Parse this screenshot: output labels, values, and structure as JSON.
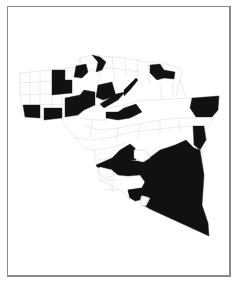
{
  "map": {
    "type": "choropleth",
    "legend": [],
    "colors": {
      "shaded": "#111111",
      "unshaded": "#ffffff",
      "boundary": "#b9b9b9",
      "frame": "#8a8a8a"
    },
    "region_outline": "20,73 50,70 78,67 80,58 92,55 112,57 125,58 148,62 160,62 173,66 182,70 180,80 186,98 198,99 218,96 218,110 210,125 205,130 207,145 202,150 204,175 202,205 208,223 209,236 150,209 140,200 130,198 120,190 110,185 100,180 97,165 95,160 95,150 85,148 75,138 68,130 62,120 58,115 42,118 35,115 22,110 20,95",
    "shaded_regions": [
      {
        "id": "nw-col",
        "points": "52,70 65,70 65,80 72,80 72,93 52,95"
      },
      {
        "id": "nw-bottom-left",
        "points": "23,105 40,105 40,118 25,117"
      },
      {
        "id": "nw-bottom",
        "points": "44,108 62,108 62,118 44,120"
      },
      {
        "id": "n-center-1",
        "points": "76,66 86,64 88,72 82,78 74,77"
      },
      {
        "id": "n-center-2",
        "points": "65,98 80,95 84,90 95,92 95,105 84,110 78,115 65,117 65,110"
      },
      {
        "id": "n-top-1",
        "points": "92,55 100,57 106,62 102,70 96,72 98,62"
      },
      {
        "id": "n-mid-1",
        "points": "98,85 112,82 116,96 103,100 96,97"
      },
      {
        "id": "n-mid-2",
        "points": "116,94 125,92 118,100 104,108 100,104"
      },
      {
        "id": "c-band",
        "points": "106,112 118,112 124,108 136,104 142,112 130,118 118,120 106,118"
      },
      {
        "id": "c-diag",
        "points": "124,90 136,78 138,80 130,90 124,96"
      },
      {
        "id": "ne-star",
        "points": "150,65 160,64 164,70 175,72 174,79 164,78 157,80 150,73"
      },
      {
        "id": "e-block",
        "points": "192,98 219,96 218,110 212,117 196,117 190,108"
      },
      {
        "id": "e-strip",
        "points": "193,126 204,126 206,140 200,150 194,145"
      },
      {
        "id": "south-main",
        "points": "96,165 112,158 120,150 130,144 135,148 136,160 130,160 144,162 160,150 175,145 186,140 194,148 200,150 204,175 202,205 208,223 209,236 150,209 143,205 148,197 140,195 130,198 128,190 142,188 145,182 140,175 128,176 118,175 112,170 97,167"
      },
      {
        "id": "south-west-lobe",
        "points": "128,190 142,188 145,182 140,200 135,201 130,198"
      }
    ],
    "unshaded_islands_in_south": [
      {
        "id": "hole-1",
        "points": "134,150 146,150 150,158 142,162 134,158"
      },
      {
        "id": "hole-2",
        "points": "143,196 150,198 146,206 140,205"
      },
      {
        "id": "hole-3",
        "points": "100,167 112,170 114,176 104,178 98,172"
      }
    ]
  }
}
